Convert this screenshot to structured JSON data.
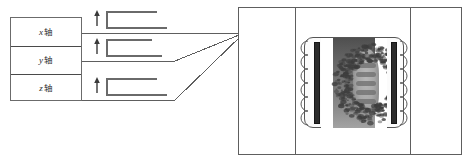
{
  "figure": {
    "axis_labels": [
      {
        "variable": "x",
        "suffix": "轴",
        "full": "x轴",
        "meaning": "x-axis"
      },
      {
        "variable": "y",
        "suffix": "轴",
        "full": "y轴",
        "meaning": "y-axis"
      },
      {
        "variable": "z",
        "suffix": "轴",
        "full": "z轴",
        "meaning": "z-axis"
      }
    ],
    "arrows": [
      {
        "name": "gradient-arrow-x",
        "direction": "up"
      },
      {
        "name": "gradient-arrow-y",
        "direction": "up"
      },
      {
        "name": "gradient-arrow-z",
        "direction": "up"
      }
    ],
    "brackets": [
      {
        "name": "coil-bracket-x"
      },
      {
        "name": "coil-bracket-y"
      },
      {
        "name": "coil-bracket-z"
      }
    ],
    "scanner": {
      "name": "scanner-housing",
      "columns": 3,
      "bore": "patient-bore",
      "coil_bars": [
        "gradient-coil-bar-left",
        "gradient-coil-bar-right"
      ],
      "scan": "anatomical-scan-image"
    },
    "colors": {
      "line": "#5e5e5e",
      "box_border": "#6b6b6b",
      "divider": "#4a4a4a",
      "coil_bar": "#2a2a2a",
      "text": "#2b2b2b",
      "background": "#ffffff"
    }
  }
}
